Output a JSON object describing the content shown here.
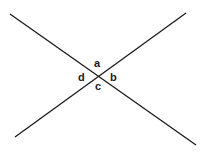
{
  "diagram": {
    "type": "intersecting-lines",
    "line_color": "#1a1a1a",
    "lines": [
      {
        "id": "line-1",
        "x1": 10,
        "y1": 14,
        "x2": 196,
        "y2": 145
      },
      {
        "id": "line-2",
        "x1": 15,
        "y1": 137,
        "x2": 186,
        "y2": 13
      }
    ],
    "intersection": {
      "x": 98,
      "y": 77
    },
    "angle_labels": {
      "a": "a",
      "b": "b",
      "c": "c",
      "d": "d"
    }
  }
}
